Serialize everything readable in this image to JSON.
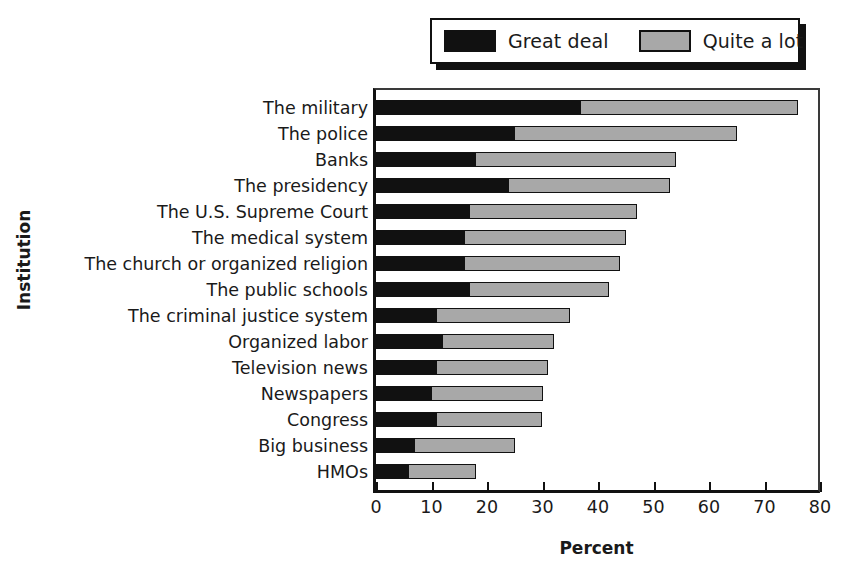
{
  "chart_data": {
    "type": "bar",
    "orientation": "horizontal",
    "stacked": true,
    "title": "",
    "xlabel": "Percent",
    "ylabel": "Institution",
    "xlim": [
      0,
      80
    ],
    "xticks": [
      0,
      10,
      20,
      30,
      40,
      50,
      60,
      70,
      80
    ],
    "grid": false,
    "legend_position": "top-right",
    "categories": [
      "The military",
      "The police",
      "Banks",
      "The presidency",
      "The U.S. Supreme Court",
      "The medical system",
      "The church or organized religion",
      "The public schools",
      "The criminal justice system",
      "Organized labor",
      "Television news",
      "Newspapers",
      "Congress",
      "Big business",
      "HMOs"
    ],
    "series": [
      {
        "name": "Great deal",
        "color": "#111111",
        "values": [
          37,
          25,
          18,
          24,
          17,
          16,
          16,
          17,
          11,
          12,
          11,
          10,
          11,
          7,
          6
        ]
      },
      {
        "name": "Quite a lot",
        "color": "#a8a8a8",
        "values": [
          39,
          40,
          36,
          29,
          30,
          29,
          28,
          25,
          24,
          20,
          20,
          20,
          19,
          18,
          12
        ]
      }
    ],
    "totals": [
      76,
      65,
      54,
      53,
      47,
      45,
      44,
      42,
      35,
      32,
      31,
      30,
      30,
      25,
      18
    ]
  },
  "legend": {
    "entries": [
      {
        "label": "Great deal",
        "swatch": "black"
      },
      {
        "label": "Quite a lot",
        "swatch": "gray"
      }
    ]
  },
  "axes": {
    "x_title": "Percent",
    "y_title": "Institution",
    "x_tick_labels": [
      "0",
      "10",
      "20",
      "30",
      "40",
      "50",
      "60",
      "70",
      "80"
    ]
  },
  "colors": {
    "great_deal": "#111111",
    "quite_a_lot": "#a8a8a8",
    "frame": "#111111",
    "background": "#ffffff"
  }
}
